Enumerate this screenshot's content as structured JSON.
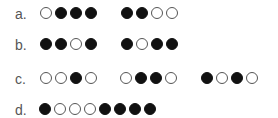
{
  "colors": {
    "filled": "#111111",
    "empty_border": "#555555",
    "label": "#555555"
  },
  "rows": [
    {
      "label": "a.",
      "groups": [
        [
          "empty",
          "filled",
          "filled",
          "filled"
        ],
        [
          "filled",
          "filled",
          "empty",
          "empty"
        ]
      ]
    },
    {
      "label": "b.",
      "groups": [
        [
          "filled",
          "filled",
          "empty",
          "filled"
        ],
        [
          "filled",
          "empty",
          "filled",
          "filled"
        ]
      ]
    },
    {
      "label": "c.",
      "groups": [
        [
          "empty",
          "empty",
          "filled",
          "empty"
        ],
        [
          "empty",
          "filled",
          "filled",
          "empty"
        ],
        [
          "filled",
          "empty",
          "filled",
          "empty"
        ]
      ]
    },
    {
      "label": "d.",
      "groups": [
        [
          "filled",
          "empty",
          "empty",
          "empty",
          "filled",
          "filled",
          "filled",
          "filled"
        ]
      ]
    }
  ]
}
